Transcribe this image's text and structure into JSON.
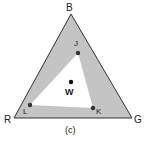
{
  "diagram": {
    "caption": "(c)",
    "vertices": {
      "top": {
        "label": "B",
        "x": 71,
        "y": 14
      },
      "left": {
        "label": "R",
        "x": 14,
        "y": 118
      },
      "right": {
        "label": "G",
        "x": 132,
        "y": 118
      }
    },
    "inner_points": [
      {
        "label": "J",
        "x": 78,
        "y": 53
      },
      {
        "label": "K",
        "x": 93,
        "y": 108
      },
      {
        "label": "L",
        "x": 30,
        "y": 105
      }
    ],
    "white_point": {
      "label": "W",
      "x": 71,
      "y": 82
    },
    "colors": {
      "fill": "#c4c4c4",
      "inner_fill": "#ffffff",
      "stroke": "#333333",
      "dot": "#333333"
    }
  }
}
